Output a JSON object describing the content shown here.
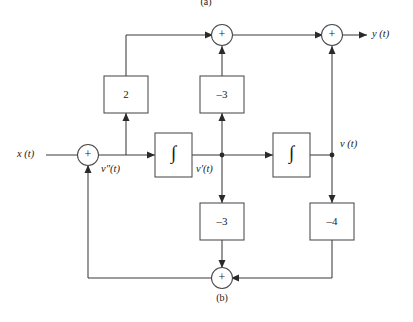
{
  "figure": {
    "caption_top": "(a)",
    "caption_bottom": "(b)",
    "type": "block-diagram"
  },
  "signals": {
    "input": "x (t)",
    "output": "y (t)",
    "node_second_derivative": "v″(t)",
    "node_first_derivative": "v′(t)",
    "node_state": "v (t)"
  },
  "blocks": {
    "gain_top_left": "2",
    "gain_top_mid": "–3",
    "gain_bottom_mid": "–3",
    "gain_bottom_right": "–4",
    "integrator_1": "∫",
    "integrator_2": "∫"
  },
  "summers": {
    "input_summer": "+",
    "output_summer_mid": "+",
    "output_summer_right": "+",
    "feedback_summer": "+"
  },
  "colors": {
    "line": "#3a3a3a",
    "box_stroke": "#4a4a4a",
    "text": "#1a1a1a",
    "background": "#ffffff"
  }
}
